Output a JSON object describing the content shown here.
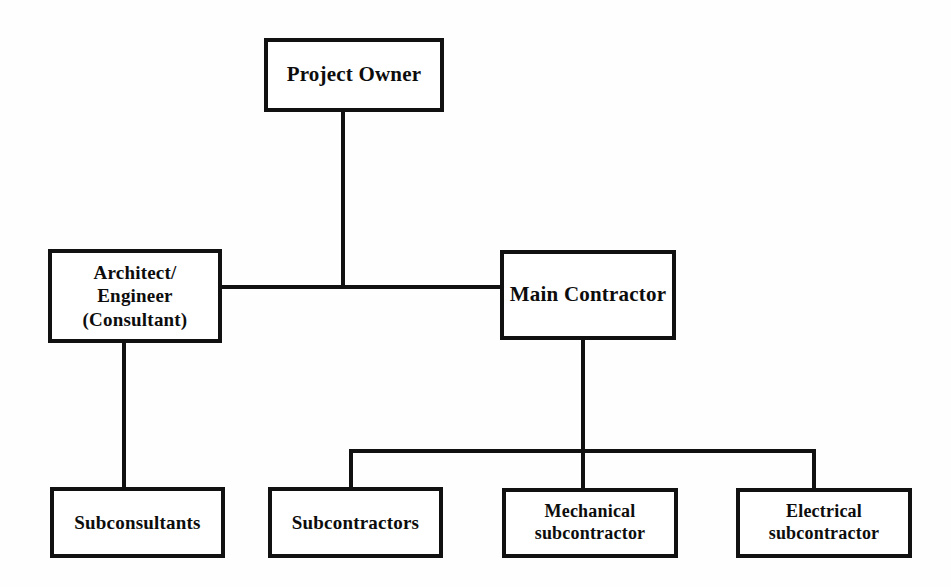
{
  "diagram": {
    "type": "organization-chart",
    "colors": {
      "line": "#111111",
      "box_fill": "#ffffff",
      "text": "#0d0d0d",
      "background": "#fefefe"
    },
    "nodes": [
      {
        "id": "project-owner",
        "label": "Project Owner",
        "level": 1,
        "x": 264,
        "y": 38,
        "w": 180,
        "h": 74
      },
      {
        "id": "architect-engineer",
        "label": "Architect/\nEngineer\n(Consultant)",
        "level": 2,
        "x": 48,
        "y": 249,
        "w": 174,
        "h": 94
      },
      {
        "id": "main-contractor",
        "label": "Main Contractor",
        "level": 2,
        "x": 500,
        "y": 250,
        "w": 176,
        "h": 90
      },
      {
        "id": "subconsultants",
        "label": "Subconsultants",
        "level": 3,
        "x": 50,
        "y": 487,
        "w": 175,
        "h": 71
      },
      {
        "id": "subcontractors",
        "label": "Subcontractors",
        "level": 3,
        "x": 268,
        "y": 487,
        "w": 175,
        "h": 71
      },
      {
        "id": "mechanical-subcontractor",
        "label": "Mechanical\nsubcontractor",
        "level": 3,
        "x": 502,
        "y": 488,
        "w": 176,
        "h": 70
      },
      {
        "id": "electrical-subcontractor",
        "label": "Electrical\nsubcontractor",
        "level": 3,
        "x": 736,
        "y": 488,
        "w": 176,
        "h": 70
      }
    ],
    "edges": [
      {
        "from": "project-owner",
        "to": "trunk-bus"
      },
      {
        "from": "trunk-bus",
        "to": "architect-engineer"
      },
      {
        "from": "trunk-bus",
        "to": "main-contractor"
      },
      {
        "from": "architect-engineer",
        "to": "subconsultants"
      },
      {
        "from": "main-contractor",
        "to": "subcontractors"
      },
      {
        "from": "main-contractor",
        "to": "mechanical-subcontractor"
      },
      {
        "from": "main-contractor",
        "to": "electrical-subcontractor"
      }
    ]
  }
}
